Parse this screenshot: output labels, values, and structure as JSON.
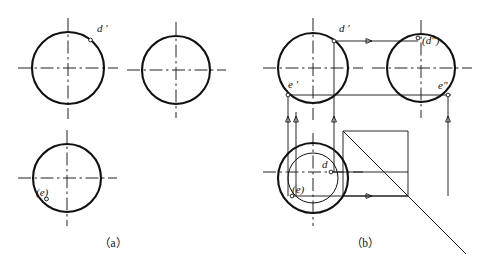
{
  "figure": {
    "title_visible": false,
    "panels": [
      {
        "id": "panel-a",
        "caption": "（a）",
        "description": "three empty circular views",
        "labels": [
          {
            "name": "label-d-prime",
            "text": "d ′"
          },
          {
            "name": "label-e-paren",
            "text": "(e)"
          }
        ]
      },
      {
        "id": "panel-b",
        "caption": "（b）",
        "description": "three circular views with projection construction lines",
        "labels": [
          {
            "name": "label-d-prime",
            "text": "d ′"
          },
          {
            "name": "label-d-double-prime",
            "text": "(d″)"
          },
          {
            "name": "label-e-prime",
            "text": "e ′"
          },
          {
            "name": "label-e-double-prime",
            "text": "e″"
          },
          {
            "name": "label-d",
            "text": "d"
          },
          {
            "name": "label-e-paren",
            "text": "(e)"
          }
        ]
      }
    ]
  },
  "colors": {
    "stroke": "#111111",
    "background": "#ffffff",
    "centerline": "#222222"
  },
  "geometry": {
    "panel_a": {
      "front_circle": {
        "cx": 68,
        "cy": 68,
        "r": 36
      },
      "side_circle": {
        "cx": 176,
        "cy": 70,
        "r": 34
      },
      "top_circle": {
        "cx": 67,
        "cy": 178,
        "r": 34
      },
      "point_d_prime": {
        "x": 90,
        "y": 40
      },
      "point_e": {
        "x": 47,
        "y": 196
      }
    },
    "panel_b": {
      "front_circle": {
        "cx": 313,
        "cy": 68,
        "r": 35
      },
      "side_circle": {
        "cx": 421,
        "cy": 68,
        "r": 34
      },
      "top_circle_outer": {
        "cx": 313,
        "cy": 178,
        "r": 35
      },
      "top_circle_inner": {
        "cx": 313,
        "cy": 178,
        "r": 25
      },
      "point_d_prime": {
        "x": 334,
        "y": 41
      },
      "point_d_double_prime": {
        "x": 421,
        "y": 38
      },
      "point_e_prime": {
        "x": 288,
        "y": 95
      },
      "point_e_double_prime": {
        "x": 448,
        "y": 95
      },
      "point_d": {
        "x": 331,
        "y": 172
      },
      "point_e": {
        "x": 292,
        "y": 196
      }
    }
  }
}
